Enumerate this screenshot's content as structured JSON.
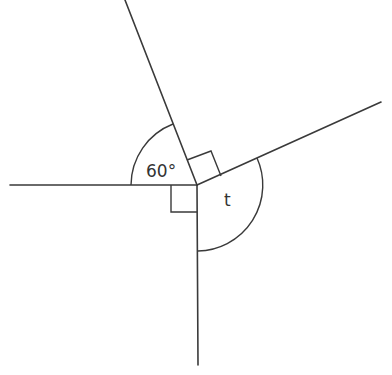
{
  "diagram": {
    "type": "angles-at-a-point",
    "center": {
      "x": 197,
      "y": 185
    },
    "rays": [
      {
        "name": "left",
        "x": 10,
        "y": 185
      },
      {
        "name": "upper",
        "x": 125,
        "y": 0
      },
      {
        "name": "right",
        "x": 381,
        "y": 102
      },
      {
        "name": "bottom",
        "x": 198,
        "y": 365
      }
    ],
    "angles": [
      {
        "label": "60°",
        "between": [
          "left",
          "upper"
        ],
        "marker": "arc"
      },
      {
        "label": "",
        "between": [
          "upper",
          "right"
        ],
        "marker": "right-angle"
      },
      {
        "label": "t",
        "between": [
          "right",
          "bottom"
        ],
        "marker": "arc"
      },
      {
        "label": "",
        "between": [
          "bottom",
          "left"
        ],
        "marker": "right-angle"
      }
    ],
    "labels": {
      "angle_60": "60°",
      "angle_t": "t"
    }
  }
}
